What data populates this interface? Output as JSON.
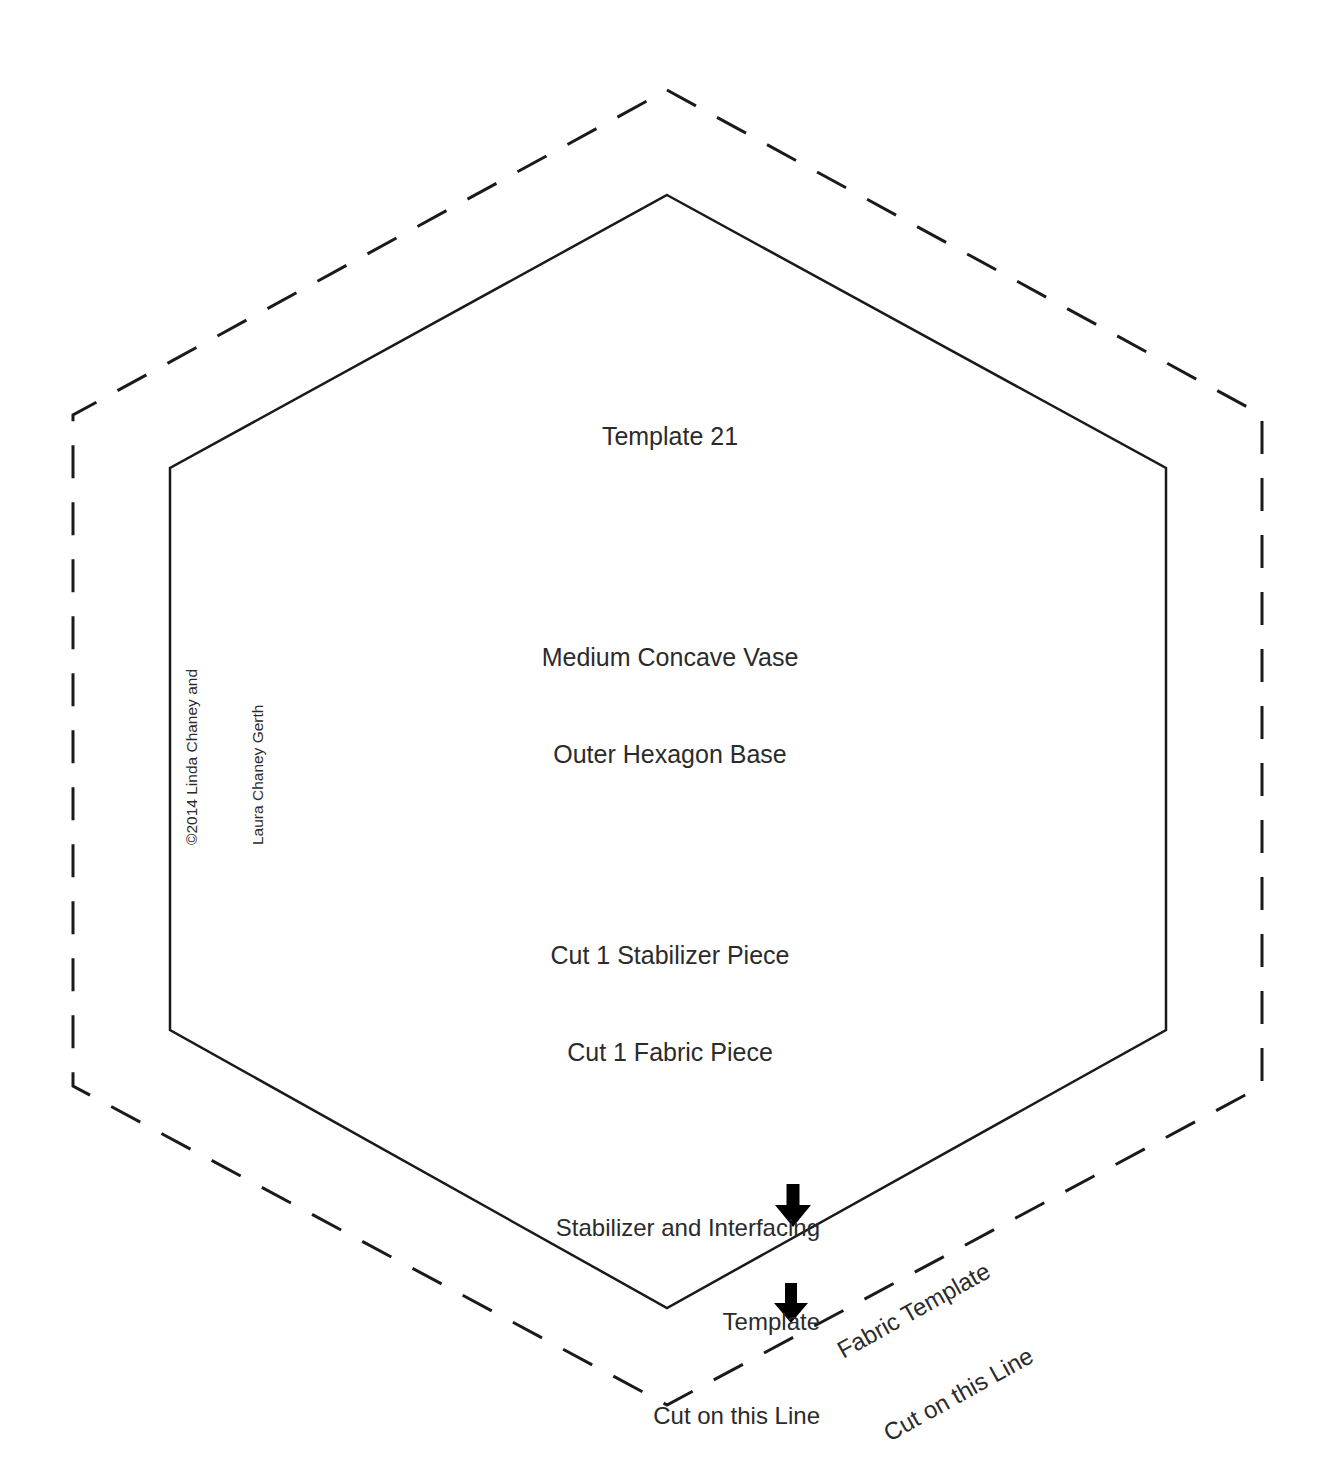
{
  "document": {
    "type": "quilting-sewing-template",
    "page_background": "#ffffff",
    "ink_color": "#2b2b2b",
    "line_color": "#1a1a1a"
  },
  "title_block": {
    "template_number": "Template 21",
    "name_line_1": "Medium Concave Vase",
    "name_line_2": "Outer Hexagon Base",
    "cut_line_1": "Cut 1 Stabilizer Piece",
    "cut_line_2": "Cut 1 Fabric Piece"
  },
  "copyright": {
    "line_1": "©2014 Linda Chaney and",
    "line_2": "Laura Chaney Gerth"
  },
  "annotations": {
    "stabilizer": {
      "line_1": "Stabilizer and Interfacing",
      "line_2": "Template",
      "line_3": "Cut on this Line",
      "arrow": "down-arrow"
    },
    "fabric": {
      "line_1": "Fabric Template",
      "line_2": "Cut on this Line",
      "arrow": "down-arrow"
    }
  },
  "shapes": {
    "inner_hexagon": {
      "style": "solid",
      "stroke_width": 2.5,
      "meaning": "Stabilizer and Interfacing cutting line",
      "points": "667,195 1166,468 1166,1030 667,1308 170,1030 170,468"
    },
    "outer_hexagon": {
      "style": "dashed",
      "stroke_width": 3,
      "dash_pattern": "33 24",
      "meaning": "Fabric cutting line",
      "points": "667,90 1262,415 1262,1086 667,1405 73,1086 73,415"
    },
    "arrow_stabilizer": {
      "shaft": "M 793,1186 L 793,1208",
      "head": "777,1206 809,1206 793,1226"
    },
    "arrow_fabric": {
      "shaft": "M 791,1285 L 791,1305",
      "head": "776,1303 806,1303 791,1322"
    }
  }
}
